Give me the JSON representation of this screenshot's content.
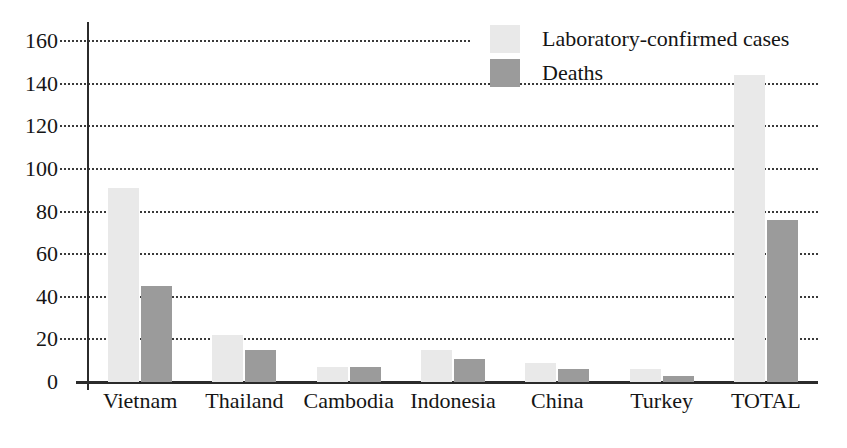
{
  "chart_data": {
    "type": "bar",
    "title": "",
    "subtitle": "",
    "xlabel": "",
    "ylabel": "",
    "ylim": [
      0,
      170
    ],
    "yticks": [
      0,
      20,
      40,
      60,
      80,
      100,
      120,
      140,
      160
    ],
    "grid": true,
    "legend_position": "top-right",
    "categories": [
      "Vietnam",
      "Thailand",
      "Cambodia",
      "Indonesia",
      "China",
      "Turkey",
      "TOTAL"
    ],
    "series": [
      {
        "name": "Laboratory-confirmed cases",
        "color": "#e9e9e9",
        "values": [
          91,
          22,
          7,
          15,
          9,
          6,
          144
        ]
      },
      {
        "name": "Deaths",
        "color": "#9b9b9b",
        "values": [
          45,
          15,
          7,
          11,
          6,
          3,
          76
        ]
      }
    ]
  },
  "legend": {
    "items": [
      {
        "label": "Laboratory-confirmed cases",
        "swatch": "cases"
      },
      {
        "label": "Deaths",
        "swatch": "deaths"
      }
    ]
  },
  "colors": {
    "cases": "#e9e9e9",
    "deaths": "#9b9b9b",
    "axis": "#2b2b2b",
    "grid": "#3a3a3a",
    "text": "#151515",
    "background": "#ffffff"
  }
}
